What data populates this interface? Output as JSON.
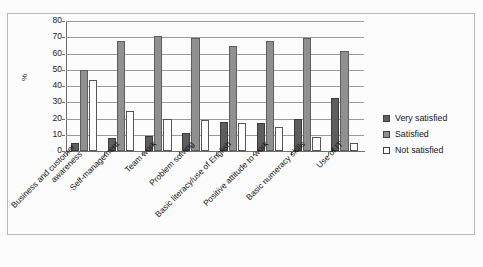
{
  "chart_data": {
    "type": "bar",
    "title": "",
    "subtitle": "",
    "xlabel": "",
    "ylabel": "%",
    "ylim": [
      0,
      80
    ],
    "yticks": [
      0,
      10,
      20,
      30,
      40,
      50,
      60,
      70,
      80
    ],
    "grid": true,
    "legend_position": "right",
    "categories": [
      "Business and customer awareness",
      "Self-management",
      "Team work",
      "Problem solving",
      "Basic literacy/use of English",
      "Positive attitude to work",
      "Basic numeracy skills",
      "Use of IT"
    ],
    "category_lines": [
      [
        "Business and customer",
        "awareness"
      ],
      [
        "Self-management"
      ],
      [
        "Team work"
      ],
      [
        "Problem solving"
      ],
      [
        "Basic literacy/use of English"
      ],
      [
        "Positive attitude to work"
      ],
      [
        "Basic numeracy skills"
      ],
      [
        "Use of IT"
      ]
    ],
    "series": [
      {
        "name": "Very satisfied",
        "color": "#5e5e5e",
        "values": [
          5,
          8,
          9,
          11,
          18,
          17,
          19.5,
          32.5
        ]
      },
      {
        "name": "Satisfied",
        "color": "#909090",
        "values": [
          50,
          68,
          71,
          69.5,
          64.5,
          68,
          69.5,
          61.5
        ]
      },
      {
        "name": "Not satisfied",
        "color": "#fdfdfd",
        "values": [
          44,
          24.5,
          20,
          19,
          17,
          15,
          8.5,
          5
        ]
      }
    ]
  },
  "legend": {
    "items": [
      {
        "label": "Very satisfied"
      },
      {
        "label": "Satisfied"
      },
      {
        "label": "Not satisfied"
      }
    ]
  },
  "axis": {
    "y_title": "%"
  }
}
